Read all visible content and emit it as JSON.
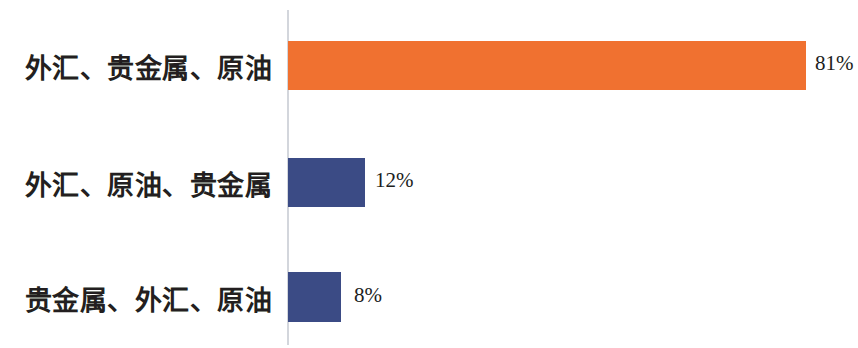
{
  "chart_data": {
    "type": "bar",
    "orientation": "horizontal",
    "title": "",
    "subtitle": "",
    "xlabel": "",
    "ylabel": "",
    "categories": [
      "外汇、贵金属、原油",
      "外汇、原油、贵金属",
      "贵金属、外汇、原油"
    ],
    "values": [
      81,
      12,
      8
    ],
    "value_labels": [
      "81%",
      "12%",
      "8%"
    ],
    "units": "%",
    "xlim": [
      0,
      100
    ],
    "grid": false,
    "legend": false,
    "legend_position": "none",
    "bar_colors": [
      "#f07130",
      "#3b4b85",
      "#3b4b85"
    ],
    "axis_color": "#d3d6dc",
    "background": "#ffffff",
    "bars": [
      {
        "category": "外汇、贵金属、原油",
        "value": 81,
        "value_label": "81%",
        "color": "#f07130",
        "bar_width_px": 518,
        "label_offset_px": 527
      },
      {
        "category": "外汇、原油、贵金属",
        "value": 12,
        "value_label": "12%",
        "color": "#3b4b85",
        "bar_width_px": 77,
        "label_offset_px": 87
      },
      {
        "category": "贵金属、外汇、原油",
        "value": 8,
        "value_label": "8%",
        "color": "#3b4b85",
        "bar_width_px": 53,
        "label_offset_px": 66
      }
    ]
  }
}
